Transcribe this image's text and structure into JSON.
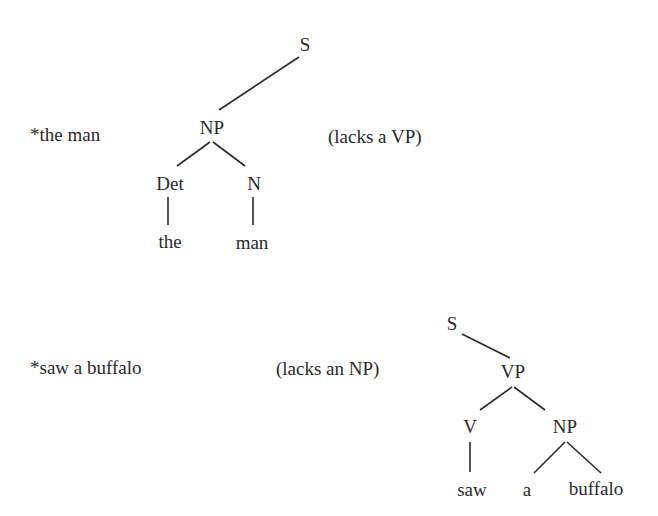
{
  "examples": [
    {
      "phrase": "*the man",
      "note": "(lacks a VP)",
      "tree": {
        "S": "S",
        "NP": "NP",
        "Det": "Det",
        "N": "N",
        "words": [
          "the",
          "man"
        ]
      }
    },
    {
      "phrase": "*saw a buffalo",
      "note": "(lacks an NP)",
      "tree": {
        "S": "S",
        "VP": "VP",
        "V": "V",
        "NP": "NP",
        "words": [
          "saw",
          "a",
          "buffalo"
        ]
      }
    }
  ]
}
